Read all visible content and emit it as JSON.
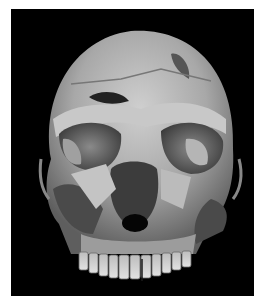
{
  "image": {
    "subject": "fossil hominin skull, frontal view",
    "style": "grayscale photograph",
    "colors": {
      "page_background": "#ffffff",
      "photo_background": "#000000",
      "bone_light": "#d8d8d8",
      "bone_mid": "#9a9a9a",
      "bone_dark": "#5a5a5a",
      "cavity": "#1a1a1a"
    }
  }
}
